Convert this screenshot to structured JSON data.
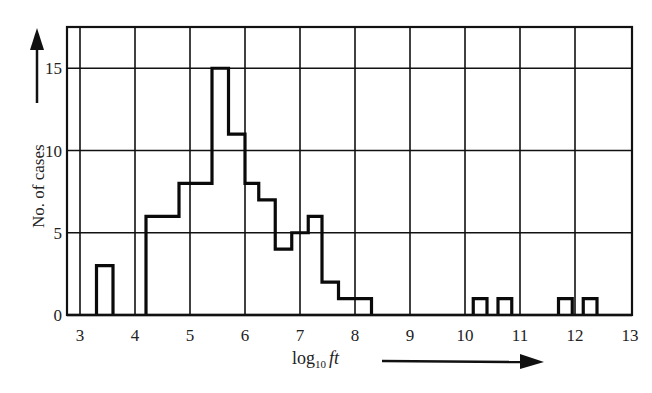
{
  "chart_data": {
    "type": "bar",
    "subtype": "histogram",
    "title": "",
    "xlabel": "log10 ft",
    "ylabel": "No. of cases",
    "xlim": [
      2.8,
      13.05
    ],
    "ylim": [
      0,
      17.5
    ],
    "xticks": [
      3,
      4,
      5,
      6,
      7,
      8,
      9,
      10,
      11,
      12,
      13
    ],
    "yticks": [
      0,
      5,
      10,
      15
    ],
    "grid": true,
    "legend": null,
    "bins": [
      {
        "x0": 3.3,
        "x1": 3.6,
        "count": 3
      },
      {
        "x0": 4.2,
        "x1": 4.8,
        "count": 6
      },
      {
        "x0": 4.8,
        "x1": 5.4,
        "count": 8
      },
      {
        "x0": 5.4,
        "x1": 5.7,
        "count": 15
      },
      {
        "x0": 5.7,
        "x1": 6.0,
        "count": 11
      },
      {
        "x0": 6.0,
        "x1": 6.25,
        "count": 8
      },
      {
        "x0": 6.25,
        "x1": 6.55,
        "count": 7
      },
      {
        "x0": 6.55,
        "x1": 6.85,
        "count": 4
      },
      {
        "x0": 6.85,
        "x1": 7.15,
        "count": 5
      },
      {
        "x0": 7.15,
        "x1": 7.4,
        "count": 6
      },
      {
        "x0": 7.4,
        "x1": 7.7,
        "count": 2
      },
      {
        "x0": 7.7,
        "x1": 8.3,
        "count": 1
      },
      {
        "x0": 10.15,
        "x1": 10.4,
        "count": 1
      },
      {
        "x0": 10.6,
        "x1": 10.85,
        "count": 1
      },
      {
        "x0": 11.7,
        "x1": 11.95,
        "count": 1
      },
      {
        "x0": 12.15,
        "x1": 12.4,
        "count": 1
      }
    ]
  },
  "labels": {
    "ylabel": "No. of cases",
    "xlabel_main": "log",
    "xlabel_sub": "10",
    "xlabel_var": "ft"
  }
}
